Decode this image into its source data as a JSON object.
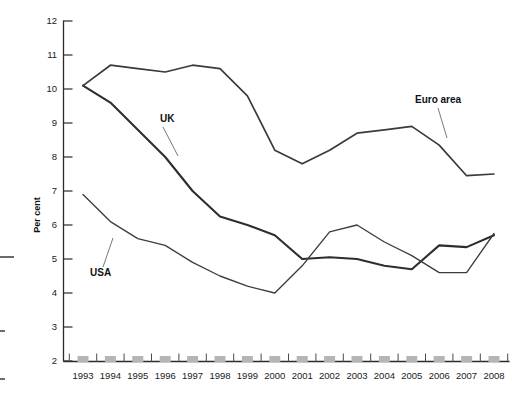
{
  "chart_data": {
    "type": "line",
    "title": "",
    "subtitle": "",
    "xlabel": "",
    "ylabel": "Per cent",
    "ylim": [
      2,
      12
    ],
    "ytick_step": 1,
    "grid": false,
    "legend_position": "inline-annotations",
    "categories": [
      "1993",
      "1994",
      "1995",
      "1996",
      "1997",
      "1998",
      "1999",
      "2000",
      "2001",
      "2002",
      "2003",
      "2004",
      "2005",
      "2006",
      "2007",
      "2008"
    ],
    "yticks": [
      "2",
      "3",
      "4",
      "5",
      "6",
      "7",
      "8",
      "9",
      "10",
      "11",
      "12"
    ],
    "series": [
      {
        "name": "UK",
        "annotation": "UK",
        "color": "#2e2e2e",
        "values": [
          10.1,
          9.6,
          8.8,
          8.0,
          7.0,
          6.25,
          6.0,
          5.7,
          5.0,
          5.05,
          5.0,
          4.8,
          4.7,
          5.4,
          5.35,
          5.7
        ]
      },
      {
        "name": "USA",
        "annotation": "USA",
        "color": "#3d3d3d",
        "values": [
          6.9,
          6.1,
          5.6,
          5.4,
          4.9,
          4.5,
          4.2,
          4.0,
          4.8,
          5.8,
          6.0,
          5.5,
          5.1,
          4.6,
          4.6,
          5.75
        ]
      },
      {
        "name": "Euro area",
        "annotation": "Euro area",
        "color": "#3a3a3a",
        "values": [
          10.1,
          10.7,
          10.6,
          10.5,
          10.7,
          10.6,
          9.8,
          8.2,
          7.8,
          8.2,
          8.7,
          8.8,
          8.9,
          8.35,
          7.45,
          7.5
        ]
      }
    ],
    "annotations": [
      {
        "text": "UK",
        "label_x": 160,
        "label_y": 122,
        "leader_x1": 163,
        "leader_y1": 127,
        "leader_x2": 178,
        "leader_y2": 156
      },
      {
        "text": "USA",
        "label_x": 90,
        "label_y": 276,
        "leader_x1": 103,
        "leader_y1": 267,
        "leader_x2": 113,
        "leader_y2": 238
      },
      {
        "text": "Euro area",
        "label_x": 415,
        "label_y": 103,
        "leader_x1": 438,
        "leader_y1": 108,
        "leader_x2": 447,
        "leader_y2": 138
      }
    ]
  },
  "axes": {
    "y_axis_title": "Per cent"
  }
}
